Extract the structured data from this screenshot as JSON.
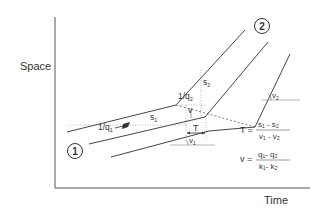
{
  "axes": {
    "y_label": "Space",
    "x_label": "Time"
  },
  "regions": {
    "region_1": "1",
    "region_2": "2"
  },
  "labels": {
    "inv_q1": "1/q",
    "inv_q1_sub": "1",
    "inv_q2": "1/q",
    "inv_q2_sub": "2",
    "s1": "s",
    "s1_sub": "1",
    "s2": "s",
    "s2_sub": "2",
    "v": "v",
    "T": "T",
    "v1": "v",
    "v1_sub": "1",
    "v2": "v",
    "v2_sub": "2"
  },
  "formulas": {
    "T_lhs": "T =",
    "T_num": "s₁ - s₂",
    "T_den": "v₁ - v₂",
    "v_lhs": "v =",
    "v_num": "q₁- q₂",
    "v_den": "k₁- k₂"
  },
  "colors": {
    "line": "#444444",
    "text": "#333333",
    "dotted": "#888888"
  }
}
